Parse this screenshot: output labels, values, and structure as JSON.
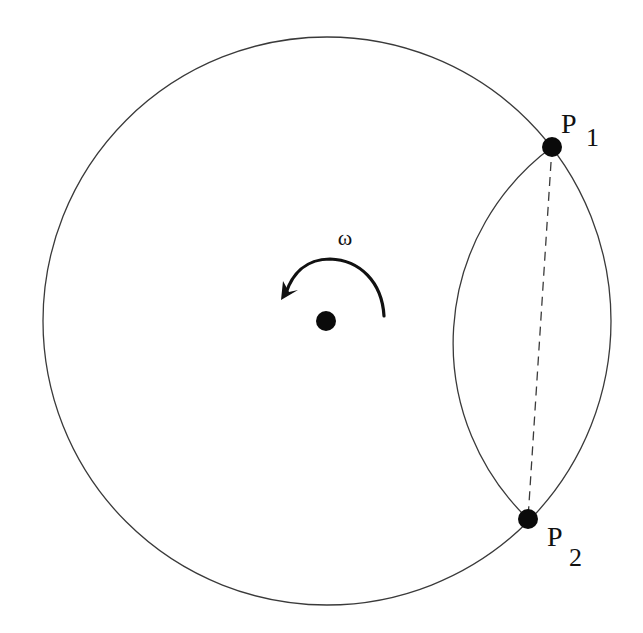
{
  "canvas": {
    "width": 643,
    "height": 633,
    "background": "#ffffff"
  },
  "colors": {
    "stroke": "#3a3a3a",
    "point_fill": "#0a0a0a",
    "text": "#111111"
  },
  "outer_circle": {
    "cx": 327,
    "cy": 321,
    "r": 284
  },
  "center_point": {
    "cx": 326,
    "cy": 321,
    "r": 10
  },
  "rotation": {
    "symbol": "ω",
    "label_x": 345,
    "label_y": 245,
    "direction": "counterclockwise"
  },
  "points": [
    {
      "id": "P1",
      "name": "P",
      "subscript": "1",
      "cx": 552,
      "cy": 147,
      "r": 10,
      "label_x": 561,
      "label_y": 133,
      "sub_x": 586,
      "sub_y": 146
    },
    {
      "id": "P2",
      "name": "P",
      "subscript": "2",
      "cx": 528,
      "cy": 519,
      "r": 10,
      "label_x": 547,
      "label_y": 546,
      "sub_x": 569,
      "sub_y": 566
    }
  ],
  "chord": {
    "style": "dashed",
    "from": "P1",
    "to": "P2"
  },
  "inner_arc": {
    "from": "P1",
    "to": "P2",
    "radius": 244,
    "bulge": "left"
  }
}
